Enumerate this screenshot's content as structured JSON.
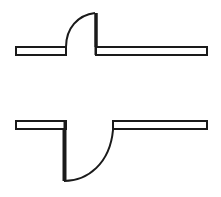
{
  "canvas": {
    "width": 221,
    "height": 197,
    "background_color": "#ffffff",
    "stroke_color": "#1a1a1a",
    "fill_color": "#ffffff",
    "title": "Two-part line drawing of stepped bar profiles with filleted risers"
  },
  "figures": [
    {
      "id": "upper-figure",
      "name": "upper-stepped-profile",
      "description": "Left bar at lower level, concave fillet curve rising to the right, vertical riser dropping to the right bar at the same lower level",
      "left_bar": {
        "name": "upper-left-bar",
        "x": 16,
        "y": 47,
        "width": 50,
        "height": 8,
        "stroke_width": 2
      },
      "right_bar": {
        "name": "upper-right-bar",
        "x": 96,
        "y": 47,
        "width": 111,
        "height": 8,
        "stroke_width": 2
      },
      "fillet_curve": {
        "name": "upper-fillet-curve",
        "start": [
          66,
          47
        ],
        "end": [
          96,
          13
        ],
        "control": [
          66,
          13
        ],
        "radius": 32,
        "stroke_width": 2
      },
      "riser": {
        "name": "upper-vertical-riser",
        "x": 96,
        "y_top": 13,
        "y_bottom": 55,
        "stroke_width": 3
      }
    },
    {
      "id": "lower-figure",
      "name": "lower-stepped-profile",
      "description": "Left bar at upper level, vertical riser dropping down, convex fillet curve sweeping right and back up to the right bar at the same upper level",
      "left_bar": {
        "name": "lower-left-bar",
        "x": 16,
        "y": 121,
        "width": 50,
        "height": 8,
        "stroke_width": 2
      },
      "right_bar": {
        "name": "lower-right-bar",
        "x": 113,
        "y": 121,
        "width": 94,
        "height": 8,
        "stroke_width": 2
      },
      "fillet_curve": {
        "name": "lower-fillet-curve",
        "start": [
          64,
          181
        ],
        "end": [
          113,
          129
        ],
        "control": [
          105,
          181
        ],
        "radius": 50,
        "stroke_width": 2
      },
      "riser": {
        "name": "lower-vertical-riser",
        "x": 64,
        "y_top": 121,
        "y_bottom": 181,
        "stroke_width": 3
      }
    }
  ]
}
